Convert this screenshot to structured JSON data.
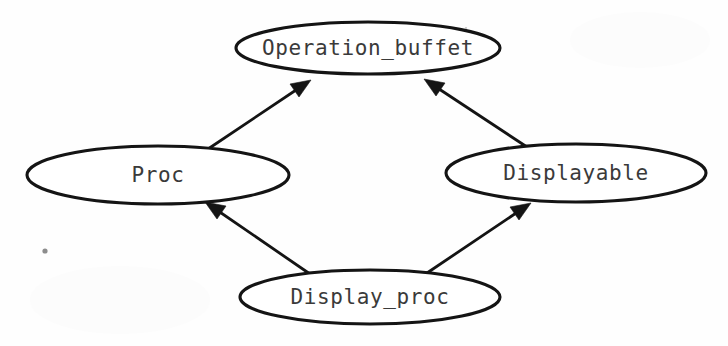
{
  "diagram": {
    "type": "class-hierarchy",
    "background_color": "#fefefe",
    "stroke_color": "#141414",
    "text_color": "#3a3a3a",
    "nodes": [
      {
        "id": "operation_buffet",
        "label": "Operation_buffet",
        "shape": "ellipse",
        "cx": 368,
        "cy": 48,
        "rx": 132,
        "ry": 26
      },
      {
        "id": "proc",
        "label": "Proc",
        "shape": "ellipse",
        "cx": 158,
        "cy": 175,
        "rx": 131,
        "ry": 29
      },
      {
        "id": "displayable",
        "label": "Displayable",
        "shape": "ellipse",
        "cx": 576,
        "cy": 173,
        "rx": 130,
        "ry": 29
      },
      {
        "id": "display_proc",
        "label": "Display_proc",
        "shape": "ellipse",
        "cx": 370,
        "cy": 297,
        "rx": 130,
        "ry": 27
      }
    ],
    "edges": [
      {
        "id": "proc-to-operation_buffet",
        "from": "proc",
        "to": "operation_buffet",
        "arrowhead": "filled-triangle",
        "x1": 208,
        "y1": 149,
        "x2": 311,
        "y2": 80
      },
      {
        "id": "displayable-to-operation_buffet",
        "from": "displayable",
        "to": "operation_buffet",
        "arrowhead": "filled-triangle",
        "x1": 527,
        "y1": 147,
        "x2": 424,
        "y2": 79
      },
      {
        "id": "display_proc-to-proc",
        "from": "display_proc",
        "to": "proc",
        "arrowhead": "filled-triangle",
        "x1": 310,
        "y1": 274,
        "x2": 205,
        "y2": 202
      },
      {
        "id": "display_proc-to-displayable",
        "from": "display_proc",
        "to": "displayable",
        "arrowhead": "filled-triangle",
        "x1": 427,
        "y1": 273,
        "x2": 531,
        "y2": 203
      }
    ]
  }
}
